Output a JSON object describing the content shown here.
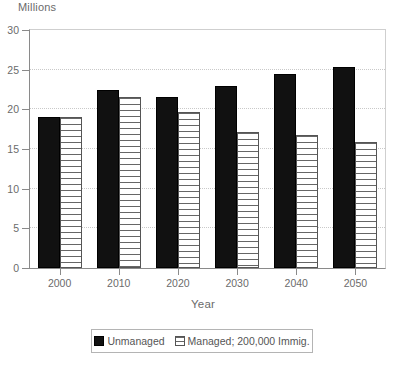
{
  "chart_data": {
    "type": "bar",
    "title": "",
    "ylabel": "Millions",
    "xlabel": "Year",
    "categories": [
      "2000",
      "2010",
      "2020",
      "2030",
      "2040",
      "2050"
    ],
    "series": [
      {
        "name": "Unmanaged",
        "values": [
          19.0,
          22.5,
          21.5,
          23.0,
          24.5,
          25.3
        ],
        "color": "#111111",
        "fill": "solid"
      },
      {
        "name": "Managed; 200,000 Immig.",
        "values": [
          19.0,
          21.5,
          19.7,
          17.1,
          16.8,
          15.9
        ],
        "color": "#ffffff",
        "fill": "horizontal-hatch"
      }
    ],
    "ylim": [
      0,
      30
    ],
    "yticks": [
      0,
      5,
      10,
      15,
      20,
      25,
      30
    ],
    "ytick_labels": [
      "0",
      "5",
      "10",
      "15",
      "20",
      "25",
      "30"
    ],
    "grid": true,
    "grid_axis": "y",
    "legend_position": "bottom",
    "axis_color": "#8a8a8a",
    "grid_color": "#c9c9c9",
    "text_color": "#6b6b6b"
  },
  "legend": {
    "entries": [
      {
        "label": "Unmanaged"
      },
      {
        "label": "Managed; 200,000 Immig."
      }
    ]
  }
}
